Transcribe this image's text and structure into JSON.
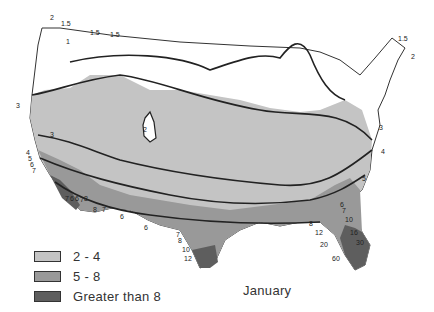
{
  "map": {
    "type": "isoline map",
    "region": "Contiguous United States",
    "month": "January",
    "legend": [
      {
        "label": "2 - 4",
        "color": "#c4c4c4"
      },
      {
        "label": "5 - 8",
        "color": "#999999"
      },
      {
        "label": "Greater than 8",
        "color": "#5e5e5e"
      }
    ],
    "isoline_labels": {
      "northwest": [
        "2",
        "1.5",
        "1",
        "1.5",
        "1.5"
      ],
      "west_coast": [
        "3",
        "3",
        "4",
        "5",
        "6",
        "7"
      ],
      "southern_california": [
        "7",
        "6",
        "6",
        "7",
        "8",
        "8",
        "7",
        "6"
      ],
      "interior_west": [
        "2"
      ],
      "northeast": [
        "1.5",
        "2",
        "3",
        "4",
        "5"
      ],
      "texas": [
        "6",
        "7",
        "8",
        "10",
        "12"
      ],
      "florida": [
        "6",
        "7",
        "8",
        "10",
        "12",
        "16",
        "20",
        "30",
        "60"
      ]
    }
  }
}
